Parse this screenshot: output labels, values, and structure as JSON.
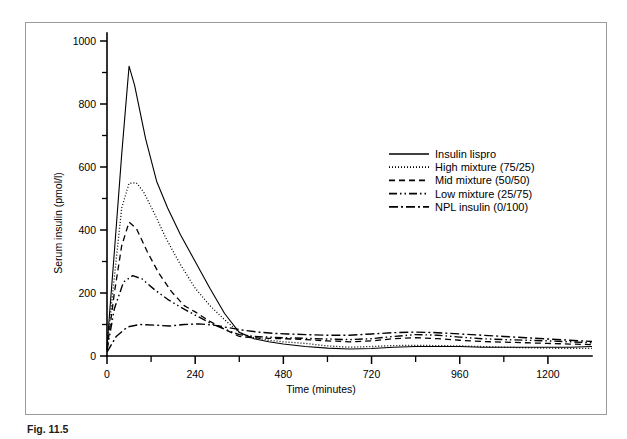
{
  "figure": {
    "caption": "Fig. 11.5",
    "border_color": "#9a9a9a"
  },
  "chart_data": {
    "type": "line",
    "title": "",
    "xlabel": "Time (minutes)",
    "ylabel": "Serum insulin (pmol/l)",
    "xlim": [
      0,
      1320
    ],
    "ylim": [
      0,
      1000
    ],
    "xticks": [
      0,
      240,
      480,
      720,
      960,
      1200
    ],
    "xtick_labels": [
      "0",
      "240",
      "480",
      "720",
      "960",
      "1200"
    ],
    "xminor_step": 120,
    "yticks": [
      0,
      200,
      400,
      600,
      800,
      1000
    ],
    "ytick_labels": [
      "0",
      "200",
      "400",
      "600",
      "800",
      "1000"
    ],
    "yminor_step": 100,
    "grid": false,
    "legend_position": "upper right",
    "axis_color": "#000000",
    "series": [
      {
        "name": "Insulin lispro",
        "dash": "none",
        "width": 1.1,
        "x": [
          0,
          20,
          40,
          60,
          75,
          105,
          135,
          165,
          200,
          240,
          280,
          320,
          360,
          400,
          440,
          480,
          540,
          600,
          660,
          720,
          780,
          840,
          900,
          960,
          1020,
          1080,
          1140,
          1200,
          1260,
          1320
        ],
        "y": [
          30,
          330,
          640,
          920,
          860,
          690,
          555,
          470,
          385,
          300,
          215,
          135,
          75,
          55,
          45,
          38,
          30,
          25,
          22,
          24,
          28,
          30,
          30,
          30,
          28,
          28,
          28,
          28,
          28,
          30
        ]
      },
      {
        "name": "High mixture (75/25)",
        "dash": "1,2",
        "width": 1.3,
        "x": [
          0,
          20,
          40,
          60,
          80,
          100,
          130,
          160,
          200,
          240,
          280,
          320,
          360,
          400,
          440,
          480,
          540,
          600,
          660,
          720,
          780,
          840,
          900,
          960,
          1020,
          1080,
          1140,
          1200,
          1260,
          1320
        ],
        "y": [
          25,
          250,
          470,
          548,
          550,
          520,
          450,
          375,
          290,
          215,
          160,
          115,
          75,
          58,
          50,
          45,
          40,
          32,
          28,
          30,
          33,
          34,
          33,
          32,
          30,
          28,
          26,
          25,
          24,
          24
        ]
      },
      {
        "name": "Mid mixture (50/50)",
        "dash": "6,4",
        "width": 1.3,
        "x": [
          0,
          20,
          40,
          60,
          80,
          110,
          140,
          175,
          210,
          240,
          280,
          320,
          360,
          400,
          440,
          480,
          540,
          600,
          660,
          720,
          780,
          840,
          900,
          960,
          1020,
          1080,
          1140,
          1200,
          1260,
          1320
        ],
        "y": [
          20,
          200,
          350,
          425,
          405,
          330,
          265,
          205,
          160,
          140,
          110,
          85,
          62,
          58,
          56,
          55,
          52,
          48,
          45,
          48,
          55,
          58,
          55,
          50,
          46,
          44,
          42,
          40,
          38,
          36
        ]
      },
      {
        "name": "Low mixture (25/75)",
        "dash": "8,3,1.5,3,1.5,3",
        "width": 1.4,
        "x": [
          0,
          20,
          45,
          70,
          95,
          130,
          165,
          200,
          240,
          280,
          320,
          360,
          400,
          440,
          480,
          540,
          600,
          660,
          720,
          780,
          840,
          900,
          960,
          1020,
          1080,
          1140,
          1200,
          1260,
          1320
        ],
        "y": [
          18,
          150,
          235,
          255,
          245,
          210,
          180,
          155,
          130,
          105,
          85,
          68,
          62,
          60,
          58,
          56,
          54,
          52,
          55,
          62,
          68,
          66,
          60,
          55,
          52,
          50,
          48,
          45,
          42
        ]
      },
      {
        "name": "NPL insulin (0/100)",
        "dash": "9,3,2,3",
        "width": 1.4,
        "x": [
          0,
          25,
          55,
          90,
          130,
          170,
          210,
          250,
          290,
          330,
          370,
          410,
          450,
          490,
          540,
          600,
          660,
          720,
          780,
          840,
          900,
          960,
          1020,
          1080,
          1140,
          1200,
          1260,
          1320
        ],
        "y": [
          12,
          62,
          92,
          100,
          98,
          95,
          100,
          102,
          98,
          90,
          82,
          76,
          72,
          70,
          68,
          66,
          66,
          70,
          74,
          76,
          74,
          70,
          66,
          62,
          58,
          54,
          50,
          46
        ]
      }
    ]
  }
}
